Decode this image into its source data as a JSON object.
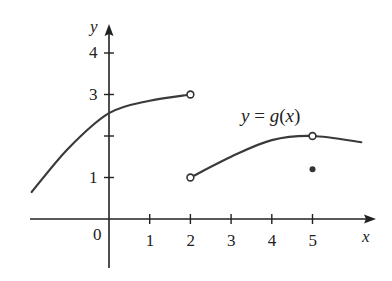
{
  "chart_data": {
    "type": "line",
    "title": "",
    "function_label": "y = g(x)",
    "xlabel": "x",
    "ylabel": "y",
    "origin_label": "0",
    "x_ticks": [
      1,
      2,
      3,
      4,
      5
    ],
    "x_tick_labels": [
      "1",
      "2",
      "3",
      "4",
      "5"
    ],
    "y_ticks": [
      1,
      2,
      3,
      4
    ],
    "y_tick_labels": [
      "1",
      "",
      "3",
      "4"
    ],
    "xlim": [
      -2.0,
      6.5
    ],
    "ylim": [
      -1.2,
      4.8
    ],
    "grid": false,
    "legend": "none",
    "series": [
      {
        "name": "left-branch",
        "points": [
          [
            -1.9,
            0.65
          ],
          [
            -1.0,
            1.7
          ],
          [
            0,
            2.55
          ],
          [
            1.0,
            2.85
          ],
          [
            2.0,
            3.0
          ]
        ],
        "end_open": true
      },
      {
        "name": "right-branch",
        "points": [
          [
            2.0,
            1.0
          ],
          [
            3.0,
            1.5
          ],
          [
            4.0,
            1.9
          ],
          [
            5.0,
            2.0
          ],
          [
            6.2,
            1.85
          ]
        ],
        "start_open": true
      }
    ],
    "open_points": [
      [
        2,
        3
      ],
      [
        2,
        1
      ],
      [
        5,
        2
      ]
    ],
    "closed_points": [
      [
        5,
        1.2
      ]
    ]
  },
  "labels": {
    "y_axis": "y",
    "x_axis": "x",
    "origin": "0",
    "fn_y": "y",
    "fn_eq": " = ",
    "fn_g": "g",
    "fn_open": "(",
    "fn_x": "x",
    "fn_close": ")"
  }
}
